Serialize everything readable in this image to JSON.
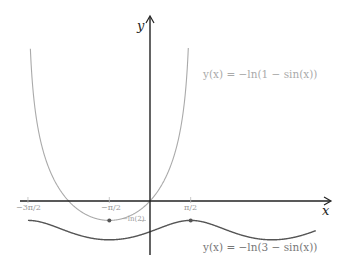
{
  "chart_data": {
    "type": "line",
    "title": "",
    "xlabel": "x",
    "ylabel": "y",
    "xlim": [
      -3.55,
      5.8
    ],
    "ylim": [
      -2.0,
      6.6
    ],
    "grid": false,
    "x_ticks": [
      {
        "value": -4.7124,
        "label": "−3π/2"
      },
      {
        "value": -1.5708,
        "label": "−π/2"
      },
      {
        "value": 1.5708,
        "label": "π/2"
      }
    ],
    "annotations": [
      {
        "text": "−ln(2)",
        "x": 0,
        "y": -0.693,
        "note": "y-level label near y-axis"
      }
    ],
    "series": [
      {
        "name": "y(x) = −ln(1 − sin(x))",
        "color": "#aaaaaa",
        "formula": "-ln(1 - sin(x))",
        "domain": [
          -4.65,
          1.52
        ],
        "marked_points": [
          {
            "x": -1.5708,
            "y": -0.693
          }
        ]
      },
      {
        "name": "y(x) = −ln(3 − sin(x))",
        "color": "#555555",
        "formula": "-ln(3 - sin(x))",
        "domain": [
          -4.7124,
          6.4
        ],
        "marked_points": [
          {
            "x": 1.5708,
            "y": -0.693
          }
        ]
      }
    ]
  },
  "labels": {
    "x_axis": "x",
    "y_axis": "y",
    "tick_neg_3pi_2": "−3π/2",
    "tick_neg_pi_2": "−π/2",
    "tick_pi_2": "π/2",
    "neg_ln2": "−ln(2)",
    "fn1": "y(x) = −ln(1 − sin(x))",
    "fn2": "y(x) = −ln(3 − sin(x))"
  },
  "colors": {
    "axis": "#222222",
    "fn1": "#aaaaaa",
    "fn2": "#555555",
    "fn1_label": "#aaaaaa",
    "fn2_label": "#777777"
  }
}
